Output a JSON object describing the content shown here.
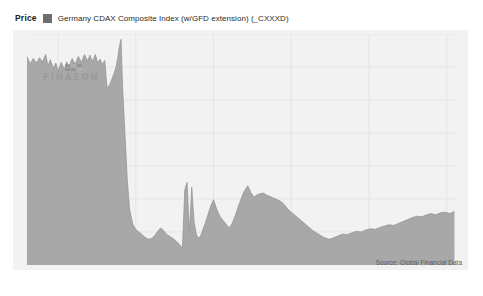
{
  "legend": {
    "price_label": "Price",
    "swatch_color": "#6e6e6e",
    "series_label": "Germany CDAX Composite Index (w/GFD extension) (_CXXXD)"
  },
  "watermark": {
    "text": "FINAEON"
  },
  "source_note": "Source: Global Financial Data",
  "chart_data": {
    "type": "area",
    "title": "Germany CDAX Composite Index (w/GFD extension) (_CXXXD)",
    "xlabel": "",
    "ylabel": "Price",
    "xlim": [
      1913.0,
      1940.6
    ],
    "ylim": [
      0,
      35
    ],
    "grid": true,
    "legend_position": "top-left",
    "plot_background": "#f2f2f2",
    "area_fill_color": "#a8a8a8",
    "gridline_color": "#dcdcdc",
    "xticks": [
      1915,
      1920,
      1925,
      1930,
      1935,
      1940
    ],
    "yticks": [
      0,
      5,
      10,
      15,
      20,
      25,
      30,
      35
    ],
    "series": [
      {
        "name": "Germany CDAX Composite Index (w/GFD extension) (_CXXXD)",
        "x": [
          1913.0,
          1913.2,
          1913.4,
          1913.6,
          1913.8,
          1914.0,
          1914.2,
          1914.35,
          1914.5,
          1914.7,
          1914.85,
          1915.0,
          1915.2,
          1915.4,
          1915.55,
          1915.7,
          1915.9,
          1916.1,
          1916.3,
          1916.5,
          1916.7,
          1916.9,
          1917.05,
          1917.2,
          1917.4,
          1917.55,
          1917.7,
          1917.85,
          1918.0,
          1918.15,
          1918.3,
          1918.45,
          1918.6,
          1918.75,
          1918.85,
          1918.95,
          1919.05,
          1919.15,
          1919.3,
          1919.45,
          1919.6,
          1919.8,
          1920.0,
          1920.2,
          1920.4,
          1920.6,
          1920.8,
          1921.0,
          1921.2,
          1921.4,
          1921.6,
          1921.8,
          1922.0,
          1922.2,
          1922.4,
          1922.6,
          1922.8,
          1923.0,
          1923.15,
          1923.3,
          1923.45,
          1923.6,
          1923.75,
          1923.9,
          1924.05,
          1924.2,
          1924.4,
          1924.6,
          1924.8,
          1925.0,
          1925.2,
          1925.4,
          1925.6,
          1925.8,
          1926.0,
          1926.2,
          1926.4,
          1926.6,
          1926.8,
          1927.0,
          1927.2,
          1927.4,
          1927.6,
          1927.8,
          1928.0,
          1928.2,
          1928.4,
          1928.6,
          1928.8,
          1929.0,
          1929.2,
          1929.4,
          1929.6,
          1929.8,
          1930.0,
          1930.2,
          1930.4,
          1930.6,
          1930.8,
          1931.0,
          1931.2,
          1931.4,
          1931.6,
          1931.8,
          1932.0,
          1932.2,
          1932.4,
          1932.6,
          1932.8,
          1933.0,
          1933.3,
          1933.6,
          1933.9,
          1934.2,
          1934.5,
          1934.8,
          1935.1,
          1935.4,
          1935.7,
          1936.0,
          1936.3,
          1936.6,
          1936.9,
          1937.2,
          1937.5,
          1937.8,
          1938.1,
          1938.4,
          1938.7,
          1939.0,
          1939.3,
          1939.6,
          1939.9,
          1940.2,
          1940.5
        ],
        "y": [
          31.6,
          30.5,
          31.3,
          30.6,
          31.4,
          30.8,
          31.9,
          30.2,
          31.1,
          29.8,
          30.6,
          29.4,
          30.7,
          29.6,
          30.8,
          30.0,
          31.3,
          30.4,
          31.6,
          30.7,
          31.9,
          30.9,
          31.8,
          30.8,
          31.9,
          30.6,
          31.2,
          30.4,
          31.0,
          26.9,
          27.2,
          28.1,
          29.0,
          30.2,
          31.6,
          33.2,
          34.2,
          27.0,
          20.0,
          13.0,
          8.5,
          6.2,
          5.4,
          5.0,
          4.6,
          4.2,
          3.9,
          4.0,
          4.4,
          5.1,
          5.6,
          5.2,
          4.6,
          4.3,
          4.0,
          3.6,
          3.1,
          2.6,
          11.4,
          12.5,
          5.0,
          11.8,
          6.5,
          4.6,
          4.0,
          4.6,
          5.9,
          7.3,
          8.8,
          9.9,
          8.5,
          7.4,
          6.8,
          6.2,
          5.6,
          6.3,
          7.5,
          8.9,
          10.2,
          11.3,
          12.0,
          11.0,
          10.3,
          10.6,
          10.8,
          10.9,
          10.6,
          10.4,
          10.2,
          10.0,
          9.8,
          9.5,
          9.0,
          8.4,
          8.0,
          7.6,
          7.2,
          6.8,
          6.4,
          6.0,
          5.6,
          5.2,
          4.9,
          4.6,
          4.3,
          4.1,
          3.9,
          4.0,
          4.2,
          4.4,
          4.7,
          4.6,
          4.9,
          5.1,
          5.0,
          5.3,
          5.5,
          5.4,
          5.7,
          5.9,
          6.1,
          6.0,
          6.3,
          6.6,
          6.9,
          7.2,
          7.4,
          7.3,
          7.6,
          7.8,
          7.6,
          7.9,
          8.0,
          7.8,
          8.1
        ]
      }
    ]
  }
}
